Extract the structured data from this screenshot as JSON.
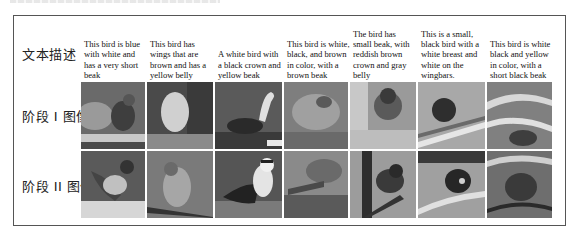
{
  "figure": {
    "row_labels": {
      "text": "文本描述",
      "stage1": "阶段 I 图像",
      "stage2": "阶段 II 图像"
    },
    "columns": [
      {
        "description": "This bird is blue with white and has a very short beak",
        "tone": "#6a6a6a"
      },
      {
        "description": "This bird has wings that are brown and has a yellow belly",
        "tone": "#5e5e5e"
      },
      {
        "description": "A white bird with a black crown and yellow beak",
        "tone": "#575757"
      },
      {
        "description": "This bird is white, black, and brown in color, with a brown beak",
        "tone": "#7a7a7a"
      },
      {
        "description": "The bird has small beak, with reddish brown crown and gray belly",
        "tone": "#8a8a8a"
      },
      {
        "description": "This is a small, black bird with a white breast and white on the wingbars.",
        "tone": "#9a9a9a"
      },
      {
        "description": "This bird is white black and yellow in color, with a short black beak",
        "tone": "#787878"
      }
    ],
    "border_color": "#555555"
  }
}
